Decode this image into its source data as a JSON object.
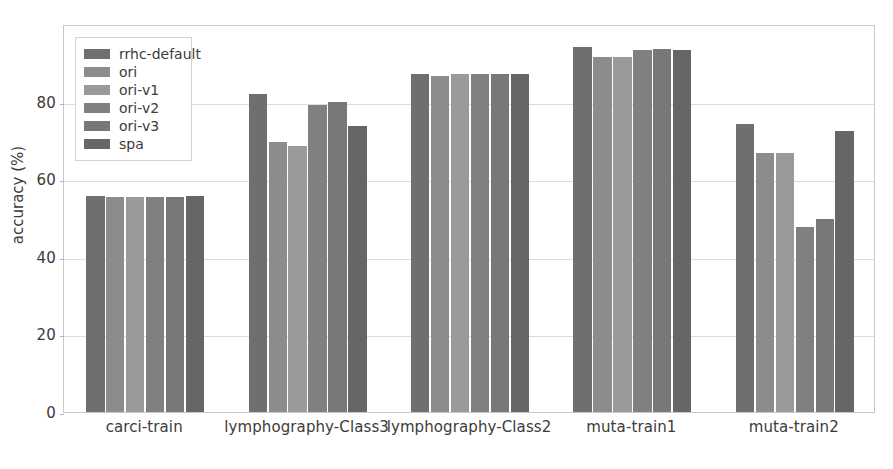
{
  "chart_data": {
    "type": "bar",
    "title": "",
    "xlabel": "",
    "ylabel": "accuracy (%)",
    "ylim": [
      0,
      100
    ],
    "yticks": [
      0,
      20,
      40,
      60,
      80
    ],
    "ytick_labels": [
      "0",
      "20",
      "40",
      "60",
      "80"
    ],
    "grid": true,
    "legend_position": "upper left",
    "categories": [
      "carci-train",
      "lymphography-Class3",
      "lymphography-Class2",
      "muta-train1",
      "muta-train2"
    ],
    "series": [
      {
        "name": "rrhc-default",
        "color": "#6f6f6f",
        "values": [
          55.6,
          82.0,
          87.0,
          94.0,
          74.2
        ]
      },
      {
        "name": "ori",
        "color": "#8c8c8c",
        "values": [
          55.3,
          69.5,
          86.5,
          91.4,
          66.8
        ]
      },
      {
        "name": "ori-v1",
        "color": "#9a9a9a",
        "values": [
          55.4,
          68.5,
          87.0,
          91.4,
          66.8
        ]
      },
      {
        "name": "ori-v2",
        "color": "#808080",
        "values": [
          55.5,
          79.2,
          87.0,
          93.3,
          47.8
        ]
      },
      {
        "name": "ori-v3",
        "color": "#787878",
        "values": [
          55.5,
          80.0,
          87.0,
          93.6,
          49.8
        ]
      },
      {
        "name": "spa",
        "color": "#666666",
        "values": [
          55.6,
          73.8,
          87.0,
          93.4,
          72.5
        ]
      }
    ]
  },
  "legend": {
    "items": [
      {
        "label": "rrhc-default"
      },
      {
        "label": "ori"
      },
      {
        "label": "ori-v1"
      },
      {
        "label": "ori-v2"
      },
      {
        "label": "ori-v3"
      },
      {
        "label": "spa"
      }
    ]
  },
  "axis": {
    "y_title": "accuracy (%)"
  }
}
